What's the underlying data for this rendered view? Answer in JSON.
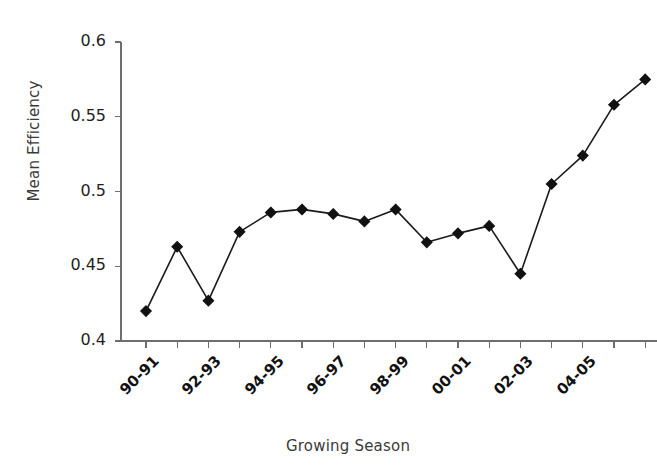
{
  "chart_data": {
    "type": "line",
    "title": "",
    "xlabel": "Growing Season",
    "ylabel": "Mean Efficiency",
    "ylim": [
      0.4,
      0.6
    ],
    "ytick_labels": [
      "0.6",
      "0.55",
      "0.5",
      "0.45",
      "0.4"
    ],
    "ytick_values": [
      0.6,
      0.55,
      0.5,
      0.45,
      0.4
    ],
    "grid": false,
    "legend": "none",
    "marker": "diamond",
    "marker_color": "#111111",
    "line_color": "#1a1a1a",
    "categories": [
      "90-91",
      "91-92",
      "92-93",
      "93-94",
      "94-95",
      "95-96",
      "96-97",
      "97-98",
      "98-99",
      "99-00",
      "00-01",
      "01-02",
      "02-03",
      "03-04",
      "04-05",
      "05-06",
      "06-07"
    ],
    "xtick_labels_shown": [
      "90-91",
      "92-93",
      "94-95",
      "96-97",
      "98-99",
      "00-01",
      "02-03",
      "04-05"
    ],
    "values": [
      0.42,
      0.463,
      0.427,
      0.473,
      0.486,
      0.488,
      0.485,
      0.48,
      0.488,
      0.466,
      0.472,
      0.477,
      0.445,
      0.505,
      0.524,
      0.558,
      0.575
    ]
  }
}
